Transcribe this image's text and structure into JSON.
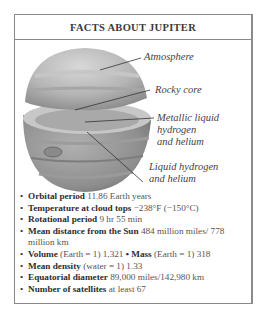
{
  "title": "FACTS ABOUT JUPITER",
  "diagram": {
    "labels": [
      {
        "text": "Atmosphere"
      },
      {
        "text": "Rocky core"
      },
      {
        "line1": "Metallic liquid",
        "line2": "hydrogen",
        "line3": "and helium"
      },
      {
        "line1": "Liquid hydrogen",
        "line2": "and helium"
      }
    ]
  },
  "facts": [
    {
      "label": "Orbital period",
      "value": "11.86 Earth years"
    },
    {
      "label": "Temperature at cloud tops",
      "value": "−238°F (−150°C)"
    },
    {
      "label": "Rotational period",
      "value": "9 hr 55 min"
    },
    {
      "label": "Mean distance from the Sun",
      "value": "484 million miles/ 778 million km"
    },
    {
      "label": "Volume",
      "qualifier": "(Earth = 1)",
      "value": "1,321",
      "label2": "Mass",
      "qualifier2": "(Earth = 1)",
      "value2": "318"
    },
    {
      "label": "Mean density",
      "qualifier": "(water = 1)",
      "value": "1.33"
    },
    {
      "label": "Equatorial diameter",
      "value": "89,000 miles/142,980 km"
    },
    {
      "label": "Number of satellites",
      "value": "at least 67"
    }
  ]
}
